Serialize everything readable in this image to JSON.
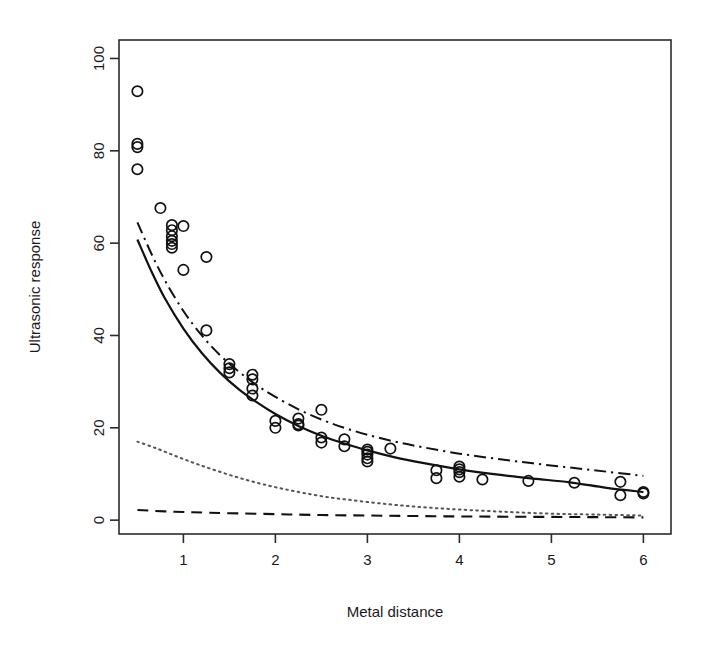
{
  "chart_data": {
    "type": "scatter",
    "title": "",
    "xlabel": "Metal distance",
    "ylabel": "Ultrasonic response",
    "xlim": [
      0.3,
      6.3
    ],
    "ylim": [
      -3.0,
      104.0
    ],
    "xticks": [
      1,
      2,
      3,
      4,
      5,
      6
    ],
    "xtick_labels": [
      "1",
      "2",
      "3",
      "4",
      "5",
      "6"
    ],
    "yticks": [
      0,
      20,
      40,
      60,
      80,
      100
    ],
    "ytick_labels": [
      "0",
      "20",
      "40",
      "60",
      "80",
      "100"
    ],
    "grid": false,
    "legend": "none",
    "box": true,
    "marker": "open-circle",
    "points": [
      {
        "x": 0.5,
        "y": 92.9
      },
      {
        "x": 0.5,
        "y": 81.5
      },
      {
        "x": 0.5,
        "y": 80.8
      },
      {
        "x": 0.5,
        "y": 76.0
      },
      {
        "x": 0.75,
        "y": 67.6
      },
      {
        "x": 0.875,
        "y": 63.9
      },
      {
        "x": 0.875,
        "y": 62.8
      },
      {
        "x": 0.875,
        "y": 61.5
      },
      {
        "x": 0.875,
        "y": 60.5
      },
      {
        "x": 0.875,
        "y": 59.8
      },
      {
        "x": 0.875,
        "y": 59.0
      },
      {
        "x": 1.0,
        "y": 63.7
      },
      {
        "x": 1.0,
        "y": 54.2
      },
      {
        "x": 1.25,
        "y": 57.0
      },
      {
        "x": 1.25,
        "y": 41.1
      },
      {
        "x": 1.5,
        "y": 33.8
      },
      {
        "x": 1.5,
        "y": 32.9
      },
      {
        "x": 1.5,
        "y": 32.0
      },
      {
        "x": 1.75,
        "y": 31.5
      },
      {
        "x": 1.75,
        "y": 30.5
      },
      {
        "x": 1.75,
        "y": 28.5
      },
      {
        "x": 1.75,
        "y": 27.0
      },
      {
        "x": 2.0,
        "y": 21.5
      },
      {
        "x": 2.0,
        "y": 20.0
      },
      {
        "x": 2.25,
        "y": 22.0
      },
      {
        "x": 2.25,
        "y": 20.8
      },
      {
        "x": 2.25,
        "y": 20.5
      },
      {
        "x": 2.5,
        "y": 23.9
      },
      {
        "x": 2.5,
        "y": 17.9
      },
      {
        "x": 2.5,
        "y": 16.8
      },
      {
        "x": 2.75,
        "y": 17.5
      },
      {
        "x": 2.75,
        "y": 16.0
      },
      {
        "x": 3.0,
        "y": 15.3
      },
      {
        "x": 3.0,
        "y": 14.8
      },
      {
        "x": 3.0,
        "y": 14.2
      },
      {
        "x": 3.0,
        "y": 13.4
      },
      {
        "x": 3.0,
        "y": 12.7
      },
      {
        "x": 3.25,
        "y": 15.5
      },
      {
        "x": 3.75,
        "y": 10.8
      },
      {
        "x": 3.75,
        "y": 9.1
      },
      {
        "x": 4.0,
        "y": 11.6
      },
      {
        "x": 4.0,
        "y": 11.0
      },
      {
        "x": 4.0,
        "y": 10.4
      },
      {
        "x": 4.0,
        "y": 9.4
      },
      {
        "x": 4.25,
        "y": 8.8
      },
      {
        "x": 4.75,
        "y": 8.5
      },
      {
        "x": 5.25,
        "y": 8.1
      },
      {
        "x": 5.75,
        "y": 8.3
      },
      {
        "x": 5.75,
        "y": 5.4
      },
      {
        "x": 6.0,
        "y": 6.1
      },
      {
        "x": 6.0,
        "y": 5.8
      }
    ],
    "series": [
      {
        "name": "fitted-curve-solid",
        "style": "solid",
        "color": "#111111",
        "x": [
          0.5,
          0.65,
          0.8,
          1.0,
          1.2,
          1.4,
          1.6,
          1.8,
          2.0,
          2.25,
          2.5,
          2.75,
          3.0,
          3.3,
          3.6,
          4.0,
          4.4,
          4.8,
          5.2,
          5.6,
          6.0
        ],
        "y": [
          60.8,
          54.0,
          48.0,
          41.5,
          36.2,
          31.9,
          28.4,
          25.5,
          23.0,
          20.4,
          18.3,
          16.6,
          15.1,
          13.6,
          12.4,
          11.0,
          9.9,
          9.0,
          8.2,
          7.0,
          6.1
        ]
      },
      {
        "name": "fitted-curve-dashdot",
        "style": "dashdot",
        "color": "#111111",
        "x": [
          0.5,
          0.65,
          0.8,
          1.0,
          1.2,
          1.4,
          1.6,
          1.8,
          2.0,
          2.25,
          2.5,
          2.75,
          3.0,
          3.3,
          3.6,
          4.0,
          4.4,
          4.8,
          5.2,
          5.6,
          6.0
        ],
        "y": [
          64.5,
          57.8,
          51.9,
          45.3,
          40.0,
          35.7,
          32.2,
          29.2,
          26.7,
          24.0,
          21.8,
          20.0,
          18.5,
          17.0,
          15.8,
          14.4,
          13.3,
          12.3,
          11.4,
          10.5,
          9.6
        ]
      },
      {
        "name": "fitted-curve-dotted",
        "style": "dotted",
        "color": "#555555",
        "x": [
          0.5,
          0.7,
          0.9,
          1.1,
          1.3,
          1.6,
          1.9,
          2.2,
          2.5,
          2.8,
          3.2,
          3.6,
          4.0,
          4.5,
          5.0,
          5.5,
          6.0
        ],
        "y": [
          17.0,
          15.6,
          14.0,
          12.5,
          11.1,
          9.2,
          7.6,
          6.3,
          5.2,
          4.4,
          3.5,
          2.8,
          2.3,
          1.8,
          1.4,
          1.2,
          1.0
        ]
      },
      {
        "name": "fitted-curve-dashed",
        "style": "dashed",
        "color": "#111111",
        "x": [
          0.5,
          0.8,
          1.1,
          1.5,
          2.0,
          2.5,
          3.0,
          3.5,
          4.0,
          4.5,
          5.0,
          5.5,
          6.0
        ],
        "y": [
          2.2,
          1.9,
          1.7,
          1.5,
          1.3,
          1.1,
          1.0,
          0.9,
          0.8,
          0.75,
          0.7,
          0.65,
          0.6
        ]
      }
    ]
  }
}
